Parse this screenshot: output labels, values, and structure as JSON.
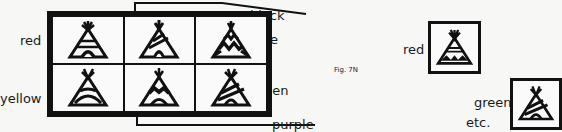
{
  "figure": {
    "caption": "Fig. 7N"
  },
  "grid": {
    "row_labels": [
      "red",
      "yellow"
    ],
    "right_labels": [
      "blue",
      "green"
    ],
    "callouts": {
      "top": "black",
      "bottom": "purple"
    },
    "cells": [
      {
        "row": 0,
        "col": 0,
        "pattern": "stripes-arch"
      },
      {
        "row": 0,
        "col": 1,
        "pattern": "diagonal-stripes"
      },
      {
        "row": 0,
        "col": 2,
        "pattern": "zigzag"
      },
      {
        "row": 1,
        "col": 0,
        "pattern": "arch"
      },
      {
        "row": 1,
        "col": 1,
        "pattern": "zigzag-band"
      },
      {
        "row": 1,
        "col": 2,
        "pattern": "diagonal-stripes"
      }
    ]
  },
  "examples": [
    {
      "label": "red",
      "pattern": "stripes-zigzag"
    },
    {
      "label": "green",
      "pattern": "diagonal-stripes",
      "note": "etc."
    }
  ],
  "colors": {
    "ink": "#111111",
    "paper": "#f7f7f5"
  }
}
